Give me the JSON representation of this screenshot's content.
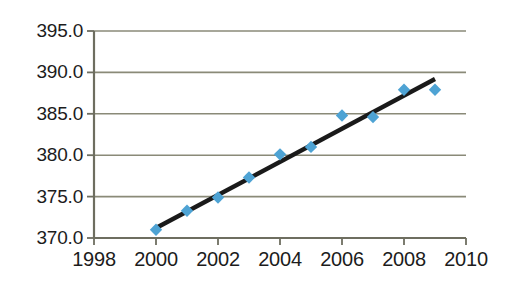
{
  "chart_data": {
    "type": "scatter",
    "title": "",
    "subtitle": "",
    "xlabel": "",
    "ylabel": "",
    "x": [
      2000,
      2001,
      2002,
      2003,
      2004,
      2005,
      2006,
      2007,
      2008,
      2009
    ],
    "values": [
      371.0,
      373.3,
      374.9,
      377.3,
      380.1,
      381.0,
      384.8,
      384.6,
      387.9,
      387.9
    ],
    "series": [
      {
        "name": "data",
        "marker": "diamond",
        "color": "#4ea3d4",
        "x": [
          2000,
          2001,
          2002,
          2003,
          2004,
          2005,
          2006,
          2007,
          2008,
          2009
        ],
        "values": [
          371.0,
          373.3,
          374.9,
          377.3,
          380.1,
          381.0,
          384.8,
          384.6,
          387.9,
          387.9
        ]
      },
      {
        "name": "trendline",
        "marker": "none",
        "color": "#1a1a1a",
        "x": [
          2000,
          2009
        ],
        "values": [
          371.2,
          389.2
        ]
      }
    ],
    "xlim": [
      1998,
      2010
    ],
    "ylim": [
      370.0,
      395.0
    ],
    "xticks": [
      1998,
      2000,
      2002,
      2004,
      2006,
      2008,
      2010
    ],
    "xtick_labels": [
      "1998",
      "2000",
      "2002",
      "2004",
      "2006",
      "2008",
      "2010"
    ],
    "yticks": [
      370.0,
      375.0,
      380.0,
      385.0,
      390.0,
      395.0
    ],
    "ytick_labels": [
      "370.0",
      "375.0",
      "380.0",
      "385.0",
      "390.0",
      "395.0"
    ],
    "grid": true,
    "grid_axis": "y",
    "legend": false,
    "legend_position": "none",
    "annotations": []
  },
  "style": {
    "background": "#ffffff",
    "grid_color": "#8a8a78",
    "axis_color": "#6e6e60",
    "tick_color": "#6e6e60",
    "marker_color": "#4ea3d4",
    "trendline_color": "#1a1a1a",
    "label_color": "#1c1c1c"
  }
}
